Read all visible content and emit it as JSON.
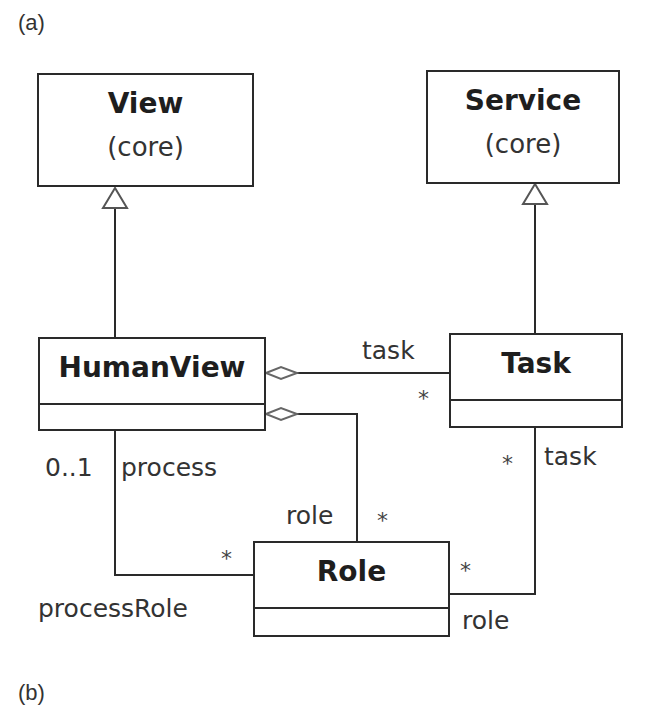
{
  "panels": {
    "a_label": "(a)",
    "b_label": "(b)"
  },
  "classes": {
    "view": {
      "name": "View",
      "stereotype": "(core)"
    },
    "service": {
      "name": "Service",
      "stereotype": "(core)"
    },
    "humanview": {
      "name": "HumanView"
    },
    "task": {
      "name": "Task"
    },
    "role": {
      "name": "Role"
    }
  },
  "relationships": {
    "humanview_view": {
      "type": "generalization"
    },
    "task_service": {
      "type": "generalization"
    },
    "humanview_task": {
      "type": "aggregation",
      "role_label": "task",
      "multiplicity": "*"
    },
    "humanview_role": {
      "type": "aggregation",
      "role_label": "role",
      "multiplicity": "*"
    },
    "humanview_processrole": {
      "type": "association",
      "source_mult": "0..1",
      "source_role": "process",
      "target_mult": "*",
      "target_role": "processRole"
    },
    "task_role": {
      "type": "association",
      "task_mult": "*",
      "task_role": "task",
      "role_mult": "*",
      "role_role": "role"
    }
  },
  "colors": {
    "line": "#2a2a2a",
    "text": "#222222",
    "background": "#ffffff"
  }
}
